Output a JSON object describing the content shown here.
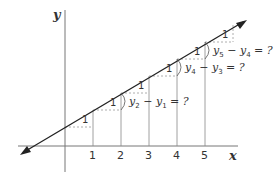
{
  "axes": {
    "x_label": "x",
    "y_label": "y",
    "x_ticks": [
      "1",
      "2",
      "3",
      "4",
      "5"
    ]
  },
  "steps": {
    "run_label": "1",
    "count": 6
  },
  "annotations": [
    {
      "id": "diff_21",
      "a": "y",
      "a_sub": "2",
      "b": "y",
      "b_sub": "1",
      "op": "−",
      "eq": "= ?"
    },
    {
      "id": "diff_43",
      "a": "y",
      "a_sub": "4",
      "b": "y",
      "b_sub": "3",
      "op": "−",
      "eq": "= ?"
    },
    {
      "id": "diff_54",
      "a": "y",
      "a_sub": "5",
      "b": "y",
      "b_sub": "4",
      "op": "−",
      "eq": "= ?"
    }
  ],
  "colors": {
    "line": "#222222",
    "axis": "#666666",
    "dashed": "#999999"
  }
}
